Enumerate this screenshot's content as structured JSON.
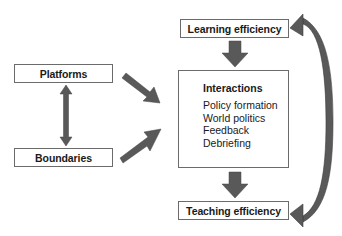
{
  "diagram": {
    "nodes": {
      "learning_efficiency": {
        "label": "Learning efficiency"
      },
      "interactions": {
        "title": "Interactions",
        "items": [
          "Policy formation",
          "World politics",
          "Feedback",
          "Debriefing"
        ]
      },
      "teaching_efficiency": {
        "label": "Teaching efficiency"
      },
      "platforms": {
        "label": "Platforms"
      },
      "boundaries": {
        "label": "Boundaries"
      }
    },
    "edges": [
      {
        "from": "learning_efficiency",
        "to": "interactions",
        "type": "block-arrow-down"
      },
      {
        "from": "interactions",
        "to": "teaching_efficiency",
        "type": "block-arrow-down"
      },
      {
        "from": "platforms",
        "to": "interactions",
        "type": "diagonal-arrow"
      },
      {
        "from": "boundaries",
        "to": "interactions",
        "type": "diagonal-arrow"
      },
      {
        "from": "platforms",
        "to": "boundaries",
        "type": "double-headed-vertical"
      },
      {
        "from": "teaching_efficiency",
        "to": "learning_efficiency",
        "type": "curved-double-headed"
      }
    ],
    "colors": {
      "arrow": "#595959",
      "arrow_edge": "#3f3f3f",
      "box_border": "#6b6b6b"
    }
  }
}
